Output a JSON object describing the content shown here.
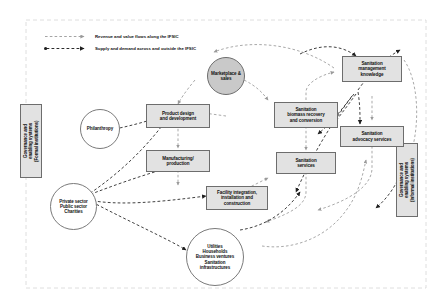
{
  "diagram": {
    "legend": [
      {
        "id": "revenue-flow",
        "label": "Revenue and value flows along the IFSIC",
        "style": "dashed-arrow-light",
        "color": "#8f8f8f"
      },
      {
        "id": "supply-demand-flow",
        "label": "Supply and demand across and outside the IFSIC",
        "style": "dashed-arrow-dark",
        "color": "#2b2b2b"
      }
    ],
    "boundary": {
      "style": "dashed",
      "color": "#d0d0d0"
    },
    "nodes": [
      {
        "id": "governance-formal",
        "label": "Governance and enabling systems (Formal institutions)",
        "shape": "vertical-box",
        "fill": "#e2e2e2"
      },
      {
        "id": "governance-informal",
        "label": "Governance and enabling systems (Informal institutions)",
        "shape": "vertical-box",
        "fill": "#e2e2e2"
      },
      {
        "id": "philanthropy",
        "label": "Philanthropy",
        "shape": "circle",
        "fill": "#ffffff"
      },
      {
        "id": "private-public-charities",
        "label": "Private sector Public sector Charities",
        "shape": "circle",
        "fill": "#ffffff",
        "lines": [
          "Private sector",
          "Public sector",
          "Charities"
        ]
      },
      {
        "id": "product-design",
        "label": "Product design and development",
        "shape": "box",
        "fill": "#e2e2e2",
        "lines": [
          "Product design",
          "and development"
        ]
      },
      {
        "id": "manufacturing",
        "label": "Manufacturing/ production",
        "shape": "box",
        "fill": "#e2e2e2",
        "lines": [
          "Manufacturing/",
          "production"
        ]
      },
      {
        "id": "facility-integration",
        "label": "Facility integration, installation and construction",
        "shape": "box",
        "fill": "#e2e2e2",
        "lines": [
          "Facility integration,",
          "installation and",
          "construction"
        ]
      },
      {
        "id": "marketplace-sales",
        "label": "Marketplace & sales",
        "shape": "circle",
        "fill": "#c9c9c9",
        "lines": [
          "Marketplace &",
          "sales"
        ]
      },
      {
        "id": "biomass-recovery",
        "label": "Sanitation biomass recovery and conversion",
        "shape": "box",
        "fill": "#e2e2e2",
        "lines": [
          "Sanitation",
          "biomass recovery",
          "and conversion"
        ]
      },
      {
        "id": "sanitation-services",
        "label": "Sanitation services",
        "shape": "box",
        "fill": "#e2e2e2",
        "lines": [
          "Sanitation",
          "services"
        ]
      },
      {
        "id": "management-knowledge",
        "label": "Sanitation management knowledge",
        "shape": "box",
        "fill": "#e2e2e2",
        "lines": [
          "Sanitation",
          "management",
          "knowledge"
        ]
      },
      {
        "id": "advocacy-services",
        "label": "Sanitation advocacy services",
        "shape": "box",
        "fill": "#e2e2e2",
        "lines": [
          "Sanitation",
          "advocacy services"
        ]
      },
      {
        "id": "end-users",
        "label": "Utilities Households Business ventures Sanitation infrastructures",
        "shape": "circle",
        "fill": "#ffffff",
        "lines": [
          "Utilities",
          "Households",
          "Business ventures",
          "Sanitation",
          "infrastructures"
        ]
      }
    ]
  },
  "labels": {
    "governance_formal_l1": "Governance and",
    "governance_formal_l2": "enabling systems",
    "governance_formal_l3": "(Formal institutions)",
    "governance_informal_l1": "Governance and",
    "governance_informal_l2": "enabling systems",
    "governance_informal_l3": "(Informal institutions)",
    "philanthropy": "Philanthropy",
    "pp_l1": "Private sector",
    "pp_l2": "Public sector",
    "pp_l3": "Charities",
    "pd_l1": "Product design",
    "pd_l2": "and development",
    "mf_l1": "Manufacturing/",
    "mf_l2": "production",
    "fi_l1": "Facility integration,",
    "fi_l2": "installation and",
    "fi_l3": "construction",
    "mp_l1": "Marketplace &",
    "mp_l2": "sales",
    "bm_l1": "Sanitation",
    "bm_l2": "biomass recovery",
    "bm_l3": "and conversion",
    "ss_l1": "Sanitation",
    "ss_l2": "services",
    "mk_l1": "Sanitation",
    "mk_l2": "management",
    "mk_l3": "knowledge",
    "ad_l1": "Sanitation",
    "ad_l2": "advocacy services",
    "eu_l1": "Utilities",
    "eu_l2": "Households",
    "eu_l3": "Business ventures",
    "eu_l4": "Sanitation",
    "eu_l5": "infrastructures",
    "legend1": "Revenue and value flows along the IFSIC",
    "legend2": "Supply and demand across and outside the IFSIC"
  }
}
